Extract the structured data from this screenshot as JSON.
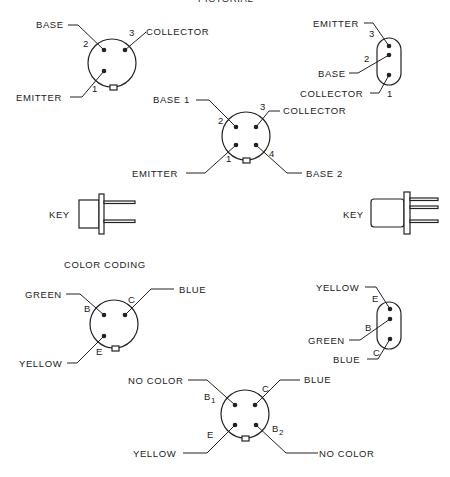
{
  "title": "PICTORIAL",
  "sections": {
    "pictorial": {
      "three_lead_round": {
        "pins": [
          {
            "number": "2",
            "label": "BASE"
          },
          {
            "number": "3",
            "label": "COLLECTOR"
          },
          {
            "number": "1",
            "label": "EMITTER"
          }
        ]
      },
      "three_lead_inline": {
        "pins": [
          {
            "number": "3",
            "label": "EMITTER"
          },
          {
            "number": "2",
            "label": "BASE"
          },
          {
            "number": "1",
            "label": "COLLECTOR"
          }
        ]
      },
      "four_lead_round": {
        "pins": [
          {
            "number": "2",
            "label": "BASE 1"
          },
          {
            "number": "3",
            "label": "COLLECTOR"
          },
          {
            "number": "1",
            "label": "EMITTER"
          },
          {
            "number": "4",
            "label": "BASE 2"
          }
        ]
      },
      "side_views": [
        {
          "label": "KEY"
        },
        {
          "label": "KEY"
        }
      ]
    },
    "color_coding": {
      "heading": "COLOR CODING",
      "three_lead_round": {
        "pins": [
          {
            "letter": "B",
            "label": "GREEN"
          },
          {
            "letter": "C",
            "label": "BLUE"
          },
          {
            "letter": "E",
            "label": "YELLOW"
          }
        ]
      },
      "three_lead_inline": {
        "pins": [
          {
            "letter": "E",
            "label": "YELLOW"
          },
          {
            "letter": "B",
            "label": "GREEN"
          },
          {
            "letter": "C",
            "label": "BLUE"
          }
        ]
      },
      "four_lead_round": {
        "pins": [
          {
            "letter": "B",
            "sub": "1",
            "label": "NO COLOR"
          },
          {
            "letter": "C",
            "label": "BLUE"
          },
          {
            "letter": "E",
            "label": "YELLOW"
          },
          {
            "letter": "B",
            "sub": "2",
            "label": "NO COLOR"
          }
        ]
      }
    }
  }
}
